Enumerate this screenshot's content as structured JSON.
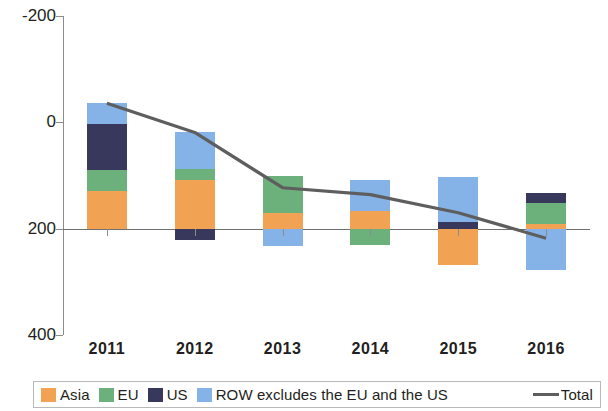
{
  "chart_data": {
    "type": "bar",
    "subtype": "stacked-bar-with-line",
    "title": "",
    "xlabel": "",
    "ylabel": "",
    "categories": [
      "2011",
      "2012",
      "2013",
      "2014",
      "2015",
      "2016"
    ],
    "ylim": [
      -200,
      400
    ],
    "yticks": [
      -200,
      0,
      200,
      400
    ],
    "ytick_labels": [
      "-200",
      "0",
      "200",
      "400"
    ],
    "grid": false,
    "legend_position": "bottom",
    "series": [
      {
        "name": "Asia",
        "color": "#F2A253",
        "values": [
          70,
          91,
          30,
          34,
          -68,
          8
        ]
      },
      {
        "name": "EU",
        "color": "#6CB17C",
        "values": [
          41,
          21,
          70,
          -30,
          0,
          41
        ]
      },
      {
        "name": "US",
        "color": "#37385C",
        "values": [
          85,
          -21,
          0,
          0,
          13,
          19
        ]
      },
      {
        "name": "ROW excludes the EU and the US",
        "color": "#85B3E8",
        "values": [
          40,
          70,
          -32,
          57,
          85,
          -77
        ]
      }
    ],
    "line_series": {
      "name": "Total",
      "color": "#5E5E5E",
      "values": [
        236,
        181,
        77,
        64,
        30,
        -18
      ]
    }
  },
  "legend": {
    "items": [
      {
        "label": "Asia",
        "icon": "color-swatch",
        "color": "#F2A253"
      },
      {
        "label": "EU",
        "icon": "color-swatch",
        "color": "#6CB17C"
      },
      {
        "label": "US",
        "icon": "color-swatch",
        "color": "#37385C"
      },
      {
        "label": "ROW excludes the EU and the US",
        "icon": "color-swatch",
        "color": "#85B3E8"
      },
      {
        "label": "Total",
        "icon": "line-swatch",
        "color": "#5E5E5E"
      }
    ]
  },
  "axis": {
    "y_labels": [
      "400",
      "200",
      "0",
      "-200"
    ],
    "x_labels": [
      "2011",
      "2012",
      "2013",
      "2014",
      "2015",
      "2016"
    ]
  }
}
